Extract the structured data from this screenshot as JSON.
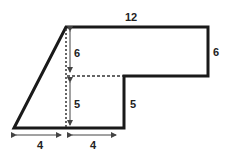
{
  "diagram": {
    "type": "composite-shape",
    "colors": {
      "outline": "#1a1a1a",
      "dashed": "#333333",
      "arrow": "#444444",
      "text": "#222222",
      "background": "#ffffff"
    },
    "labels": {
      "top_width": "12",
      "right_height": "6",
      "inner_upper_height": "6",
      "inner_lower_height": "5",
      "step_height": "5",
      "bottom_left_width": "4",
      "bottom_right_width": "4"
    }
  }
}
